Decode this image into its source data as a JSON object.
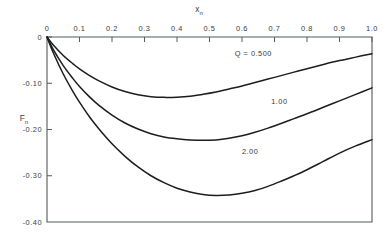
{
  "chart_data": {
    "type": "line",
    "title": "",
    "xlabel": "x_n",
    "ylabel": "F_n",
    "xlabel_base": "x",
    "xlabel_sub": "n",
    "ylabel_base": "F",
    "ylabel_sub": "n",
    "xlim": [
      0.0,
      1.0
    ],
    "ylim": [
      -0.4,
      0.0
    ],
    "grid": false,
    "legend_position": "inline-curve-labels",
    "x_axis_position": "top",
    "y_axis_position": "left",
    "xticks": [
      0.0,
      0.1,
      0.2,
      0.3,
      0.4,
      0.5,
      0.6,
      0.7,
      0.8,
      0.9,
      1.0
    ],
    "xticklabels": [
      "0",
      "0.1",
      "0.2",
      "0.3",
      "0.4",
      "0.5",
      "0.6",
      "0.7",
      "0.8",
      "0.9",
      "1.0"
    ],
    "yticks": [
      0.0,
      -0.1,
      -0.2,
      -0.3,
      -0.4
    ],
    "yticklabels": [
      "0",
      "-0.10",
      "-0.20",
      "-0.30",
      "-0.40"
    ],
    "series": [
      {
        "name": "Q = 0.500",
        "label": "Q = 0.500",
        "label_x": 0.635,
        "label_y": -0.042,
        "x": [
          0.0,
          0.02,
          0.05,
          0.08,
          0.1,
          0.13,
          0.16,
          0.2,
          0.24,
          0.28,
          0.32,
          0.36,
          0.4,
          0.44,
          0.48,
          0.52,
          0.56,
          0.6,
          0.64,
          0.68,
          0.72,
          0.76,
          0.8,
          0.85,
          0.9,
          0.95,
          1.0
        ],
        "y": [
          0.0,
          -0.018,
          -0.04,
          -0.058,
          -0.069,
          -0.083,
          -0.095,
          -0.108,
          -0.118,
          -0.125,
          -0.129,
          -0.1305,
          -0.13,
          -0.128,
          -0.124,
          -0.119,
          -0.1125,
          -0.106,
          -0.0985,
          -0.091,
          -0.0835,
          -0.076,
          -0.0685,
          -0.0595,
          -0.051,
          -0.0435,
          -0.036
        ]
      },
      {
        "name": "1.00",
        "label": "1.00",
        "label_x": 0.715,
        "label_y": -0.145,
        "x": [
          0.0,
          0.02,
          0.05,
          0.08,
          0.1,
          0.13,
          0.16,
          0.2,
          0.24,
          0.28,
          0.32,
          0.36,
          0.4,
          0.44,
          0.48,
          0.52,
          0.56,
          0.6,
          0.64,
          0.68,
          0.72,
          0.76,
          0.8,
          0.85,
          0.9,
          0.95,
          1.0
        ],
        "y": [
          0.0,
          -0.028,
          -0.062,
          -0.09,
          -0.107,
          -0.129,
          -0.148,
          -0.169,
          -0.186,
          -0.199,
          -0.209,
          -0.216,
          -0.22,
          -0.2225,
          -0.2235,
          -0.2225,
          -0.219,
          -0.2135,
          -0.206,
          -0.197,
          -0.187,
          -0.1765,
          -0.166,
          -0.152,
          -0.138,
          -0.124,
          -0.11
        ]
      },
      {
        "name": "2.00",
        "label": "2.00",
        "label_x": 0.625,
        "label_y": -0.252,
        "x": [
          0.0,
          0.02,
          0.05,
          0.08,
          0.1,
          0.13,
          0.16,
          0.2,
          0.24,
          0.28,
          0.32,
          0.36,
          0.4,
          0.44,
          0.48,
          0.52,
          0.56,
          0.6,
          0.64,
          0.68,
          0.72,
          0.76,
          0.8,
          0.85,
          0.9,
          0.95,
          1.0
        ],
        "y": [
          0.0,
          -0.035,
          -0.08,
          -0.118,
          -0.141,
          -0.172,
          -0.199,
          -0.231,
          -0.258,
          -0.281,
          -0.3,
          -0.315,
          -0.327,
          -0.335,
          -0.3405,
          -0.3425,
          -0.3415,
          -0.338,
          -0.332,
          -0.323,
          -0.312,
          -0.3,
          -0.287,
          -0.269,
          -0.251,
          -0.2355,
          -0.222
        ]
      }
    ]
  },
  "colors": {
    "background": "#ffffff",
    "axis": "#555a5d",
    "curve": "#1d1d1d",
    "text": "#3a3a3a"
  }
}
